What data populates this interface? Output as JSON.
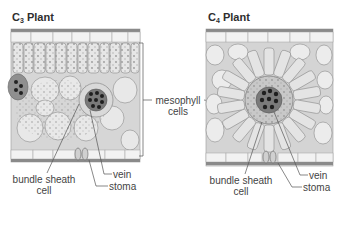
{
  "panels": [
    {
      "id": "c3",
      "title_main": "C",
      "title_sub": "3",
      "title_rest": " Plant",
      "labels": {
        "bundle_sheath_line1": "bundle sheath",
        "bundle_sheath_line2": "cell",
        "vein": "vein",
        "stoma": "stoma"
      }
    },
    {
      "id": "c4",
      "title_main": "C",
      "title_sub": "4",
      "title_rest": " Plant",
      "labels": {
        "bundle_sheath_line1": "bundle sheath",
        "bundle_sheath_line2": "cell",
        "vein": "vein",
        "stoma": "stoma"
      }
    }
  ],
  "shared_label": {
    "line1": "mesophyll",
    "line2": "cells"
  },
  "colors": {
    "epidermis_dark": "#8a8a8a",
    "cell_fill": "#e4e4e4",
    "cell_stroke": "#8c8c8c",
    "vein_dark": "#2a2a2a",
    "leader_line": "#555555"
  }
}
